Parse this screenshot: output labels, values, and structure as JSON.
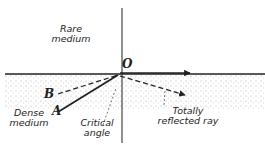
{
  "diagram": {
    "labels": {
      "rare_medium_1": "Rare",
      "rare_medium_2": "medium",
      "dense_medium_1": "Dense",
      "dense_medium_2": "medium",
      "point_o": "O",
      "ray_a": "A",
      "ray_b": "B",
      "critical_1": "Critical",
      "critical_2": "angle",
      "reflected_1": "Totally",
      "reflected_2": "reflected ray"
    },
    "colors": {
      "ink": "#222222",
      "stipple": "#9a9a9a",
      "background": "#ffffff"
    }
  }
}
